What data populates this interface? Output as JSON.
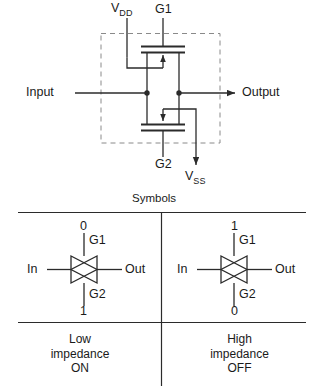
{
  "figure": {
    "line_color": "#2b2b2b",
    "dash_color": "#8a8a8a",
    "text_color": "#1a1a1a"
  },
  "circuit": {
    "supply_top_label": "V",
    "supply_top_sub": "DD",
    "supply_bottom_label": "V",
    "supply_bottom_sub": "SS",
    "gate_top_label": "G1",
    "gate_bottom_label": "G2",
    "input_label": "Input",
    "output_label": "Output"
  },
  "symbols_section": {
    "heading": "Symbols",
    "cells": [
      {
        "top_level": "0",
        "gate_top_label": "G1",
        "in_label": "In",
        "out_label": "Out",
        "gate_bottom_label": "G2",
        "bottom_level": "1",
        "state_line1": "Low",
        "state_line2": "impedance",
        "state_line3": "ON"
      },
      {
        "top_level": "1",
        "gate_top_label": "G1",
        "in_label": "In",
        "out_label": "Out",
        "gate_bottom_label": "G2",
        "bottom_level": "0",
        "state_line1": "High",
        "state_line2": "impedance",
        "state_line3": "OFF"
      }
    ]
  }
}
